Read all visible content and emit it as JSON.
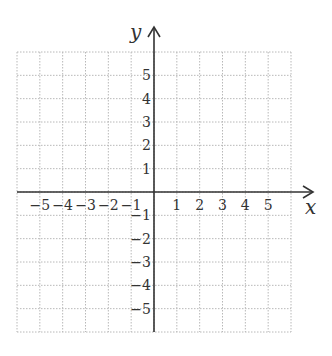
{
  "chart_data": {
    "type": "coordinate-plane",
    "title": "",
    "xlabel": "x",
    "ylabel": "y",
    "xlim": [
      -6,
      6
    ],
    "ylim": [
      -6,
      6
    ],
    "grid": true,
    "grid_style": "dotted",
    "x_ticks": [
      -5,
      -4,
      -3,
      -2,
      -1,
      1,
      2,
      3,
      4,
      5
    ],
    "y_ticks": [
      5,
      4,
      3,
      2,
      1,
      -1,
      -2,
      -3,
      -4,
      -5
    ],
    "x_tick_labels": [
      "−5",
      "−4",
      "−3",
      "−2",
      "−1",
      "1",
      "2",
      "3",
      "4",
      "5"
    ],
    "y_tick_labels": [
      "5",
      "4",
      "3",
      "2",
      "1",
      "−1",
      "−2",
      "−3",
      "−4",
      "−5"
    ],
    "series": [],
    "legend": null
  },
  "colors": {
    "axis": "#333333",
    "grid": "#b8b8b8",
    "background": "#ffffff"
  },
  "layout": {
    "grid_left": 17,
    "grid_top": 52,
    "grid_right": 291,
    "grid_bottom": 332,
    "origin_x": 154,
    "origin_y": 192,
    "y_arrow_top": 27,
    "x_arrow_right": 313
  }
}
